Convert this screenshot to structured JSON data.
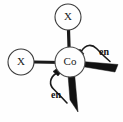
{
  "figure": {
    "background_color": "#fefefe",
    "line_color": "#1a1a1a",
    "center_atom": {
      "label": "Co",
      "x": 70,
      "y": 62,
      "radius": 15
    },
    "ligand_nodes": [
      {
        "id": "x-top",
        "label": "X",
        "x": 68,
        "y": 17,
        "radius": 13,
        "position": "top"
      },
      {
        "id": "x-left",
        "label": "X",
        "x": 21,
        "y": 62,
        "radius": 13,
        "position": "left"
      }
    ],
    "chelate_labels": [
      {
        "id": "en-right",
        "label": "en",
        "x": 104,
        "y": 53,
        "position": "upper-right"
      },
      {
        "id": "en-bottom",
        "label": "en",
        "x": 56,
        "y": 96,
        "position": "lower-left"
      }
    ],
    "bonds": [
      {
        "id": "bond-co-x-top",
        "type": "plain",
        "from": "Co",
        "to": "X"
      },
      {
        "id": "bond-co-x-left",
        "type": "plain",
        "from": "Co",
        "to": "X"
      },
      {
        "id": "bond-co-en-right",
        "type": "wedge",
        "from": "Co",
        "to": "en"
      },
      {
        "id": "bond-co-en-bottom",
        "type": "wedge",
        "from": "Co",
        "to": "en"
      },
      {
        "id": "bond-co-en-right-upper",
        "type": "wedge-short",
        "from": "Co",
        "to": "en"
      },
      {
        "id": "bond-co-en-bottom-left",
        "type": "wedge-short",
        "from": "Co",
        "to": "en"
      }
    ]
  }
}
